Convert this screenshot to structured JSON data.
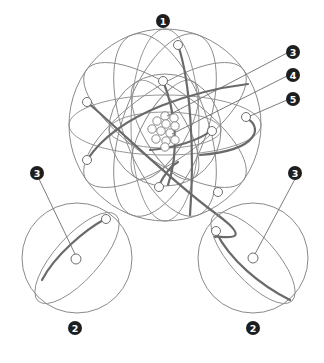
{
  "diagram": {
    "type": "atom-model-illustration",
    "labels": [
      {
        "id": "label-1",
        "text": "1"
      },
      {
        "id": "label-3-top",
        "text": "3"
      },
      {
        "id": "label-4",
        "text": "4"
      },
      {
        "id": "label-5",
        "text": "5"
      },
      {
        "id": "label-3-left",
        "text": "3"
      },
      {
        "id": "label-3-right",
        "text": "3"
      },
      {
        "id": "label-2-left",
        "text": "2"
      },
      {
        "id": "label-2-right",
        "text": "2"
      }
    ],
    "colors": {
      "badge": "#1e1e1e",
      "line": "#8a8a8a",
      "background": "#ffffff"
    }
  }
}
